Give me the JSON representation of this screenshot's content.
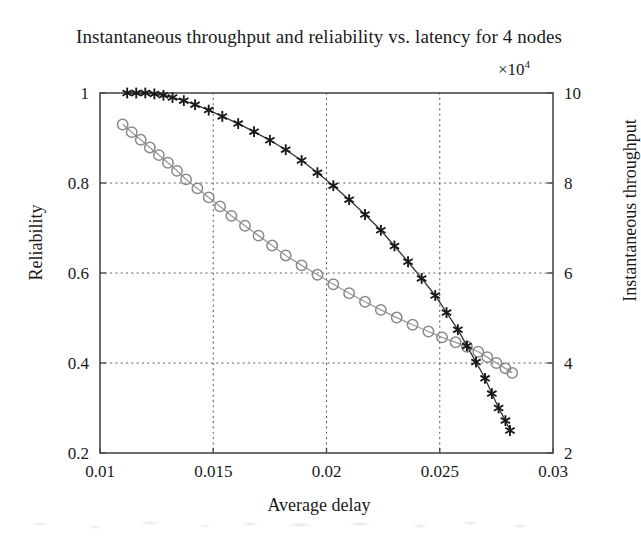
{
  "chart_data": {
    "type": "line",
    "title": "Instantaneous throughput and reliability vs. latency for 4 nodes",
    "xlabel": "Average delay",
    "ylabel": "Reliability",
    "ylabel_right": "Instantaneous throughput",
    "right_axis_multiplier": "×10",
    "right_axis_multiplier_exponent": "4",
    "xlim": [
      0.01,
      0.03
    ],
    "ylim": [
      0.2,
      1.0
    ],
    "ylim_right": [
      20000,
      100000
    ],
    "xticks": [
      0.01,
      0.015,
      0.02,
      0.025,
      0.03
    ],
    "xtick_labels": [
      "0.01",
      "0.015",
      "0.02",
      "0.025",
      "0.03"
    ],
    "yticks": [
      0.2,
      0.4,
      0.6,
      0.8,
      1
    ],
    "ytick_labels": [
      "0.2",
      "0.4",
      "0.6",
      "0.8",
      "1"
    ],
    "yticks_right": [
      2,
      4,
      6,
      8,
      10
    ],
    "ytick_labels_right": [
      "2",
      "4",
      "6",
      "8",
      "10"
    ],
    "grid": true,
    "legend": "none",
    "series": [
      {
        "name": "Reliability",
        "axis": "left",
        "marker": "circle",
        "color": "#8a8a8a",
        "line_color": "#9a9a9a",
        "x": [
          0.011,
          0.0114,
          0.0118,
          0.0122,
          0.0126,
          0.013,
          0.0134,
          0.0138,
          0.0143,
          0.0148,
          0.0153,
          0.0158,
          0.0164,
          0.017,
          0.0176,
          0.0182,
          0.0189,
          0.0196,
          0.0203,
          0.021,
          0.0217,
          0.0224,
          0.0231,
          0.0238,
          0.0245,
          0.0251,
          0.0257,
          0.0262,
          0.0267,
          0.0271,
          0.0275,
          0.0279,
          0.0282
        ],
        "y": [
          0.93,
          0.913,
          0.896,
          0.879,
          0.862,
          0.845,
          0.827,
          0.808,
          0.788,
          0.768,
          0.748,
          0.727,
          0.705,
          0.683,
          0.661,
          0.639,
          0.617,
          0.596,
          0.575,
          0.555,
          0.536,
          0.518,
          0.501,
          0.485,
          0.47,
          0.457,
          0.446,
          0.436,
          0.425,
          0.413,
          0.4,
          0.388,
          0.378
        ]
      },
      {
        "name": "Instantaneous throughput",
        "axis": "right",
        "marker": "asterisk",
        "color": "#1a1a1a",
        "line_color": "#333333",
        "x": [
          0.0112,
          0.0116,
          0.012,
          0.0124,
          0.0128,
          0.0132,
          0.0137,
          0.0142,
          0.0148,
          0.0154,
          0.0161,
          0.0168,
          0.0175,
          0.0182,
          0.0189,
          0.0196,
          0.0203,
          0.021,
          0.0217,
          0.0224,
          0.023,
          0.0236,
          0.0242,
          0.0248,
          0.0253,
          0.0258,
          0.0262,
          0.0266,
          0.027,
          0.0273,
          0.0276,
          0.0279,
          0.0281
        ],
        "y": [
          100000,
          100000,
          100000,
          99800,
          99500,
          99000,
          98300,
          97400,
          96200,
          94800,
          93200,
          91400,
          89500,
          87400,
          85000,
          82300,
          79400,
          76300,
          73000,
          69500,
          66000,
          62500,
          58800,
          55000,
          51200,
          47400,
          43800,
          40200,
          36600,
          33200,
          30000,
          27200,
          25000
        ]
      }
    ]
  },
  "axis": {
    "x_title": "Average delay",
    "y_left_title": "Reliability",
    "y_right_title": "Instantaneous throughput"
  },
  "colors": {
    "background": "#ffffff",
    "axis": "#4a4a4a",
    "grid": "#5a5a5a",
    "series_reliability": "#8a8a8a",
    "series_throughput": "#1a1a1a",
    "text": "#1a1a1a"
  }
}
